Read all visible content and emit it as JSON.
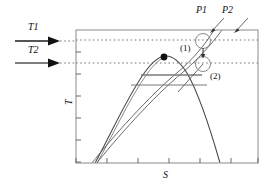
{
  "figure": {
    "type": "temperature-entropy-diagram",
    "axes": {
      "y_label": "T",
      "x_label": "S",
      "y_tick_count": 6,
      "x_tick_count": 6
    },
    "temperature_lines": [
      {
        "id": "T1",
        "label": "T1",
        "kind": "isotherm-dotted",
        "y_px": 40
      },
      {
        "id": "T2",
        "label": "T2",
        "kind": "isotherm-dotted",
        "y_px": 63
      }
    ],
    "pressure_lines": [
      {
        "id": "P1",
        "label": "P1",
        "kind": "isobar"
      },
      {
        "id": "P2",
        "label": "P2",
        "kind": "isobar"
      }
    ],
    "states": [
      {
        "id": "1",
        "label": "(1)",
        "marker": "circle",
        "cx_px": 203,
        "cy_px": 41
      },
      {
        "id": "2",
        "label": "(2)",
        "marker": "circle",
        "cx_px": 203,
        "cy_px": 64
      }
    ],
    "critical_point": {
      "marker": "filled-dot",
      "cx_px": 164,
      "cy_px": 57
    },
    "saturation_dome": {
      "kind": "vapor-dome"
    },
    "chord_lines": [
      {
        "y_px": 75
      },
      {
        "y_px": 85
      }
    ],
    "colors": {
      "ink": "#111111",
      "curve": "#444444",
      "dotted": "#777777",
      "frame": "#888888",
      "background": "#ffffff"
    }
  }
}
